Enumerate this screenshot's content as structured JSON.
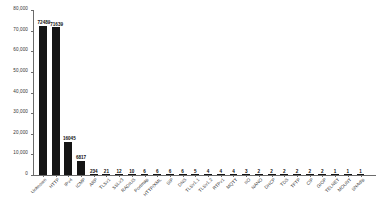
{
  "chart_data": {
    "type": "bar",
    "title": "",
    "subtitle": "",
    "xlabel": "",
    "ylabel": "",
    "ylim": [
      0,
      80000
    ],
    "grid": false,
    "legend": null,
    "y_ticks": [
      0,
      10000,
      20000,
      30000,
      40000,
      50000,
      60000,
      70000,
      80000
    ],
    "y_tick_labels": [
      "0",
      "10,000",
      "20,000",
      "30,000",
      "40,000",
      "50,000",
      "60,000",
      "70,000",
      "80,000"
    ],
    "categories": [
      "Unknown",
      "HTTP",
      "IPv4",
      "ICMP",
      "ARP",
      "TLSv1",
      "SSLv3",
      "RADIUS",
      "Portmap",
      "HTTP/XML",
      "SIP",
      "DNS",
      "TLSv1.1",
      "TLSv1.2",
      "RTPv1",
      "MQTT",
      "IIO",
      "NANO",
      "DHCP",
      "TDS",
      "TFTP",
      "CIP",
      "GIOP",
      "TELNET",
      "MOUNT",
      "SNAdlp"
    ],
    "values": [
      72489,
      71639,
      16045,
      6817,
      234,
      21,
      12,
      10,
      6,
      6,
      6,
      6,
      5,
      4,
      4,
      4,
      3,
      2,
      2,
      2,
      2,
      2,
      2,
      1,
      1,
      1
    ],
    "value_labels": [
      "72489",
      "71639",
      "16045",
      "6817",
      "234",
      "21",
      "12",
      "10",
      "6",
      "6",
      "6",
      "6",
      "5",
      "4",
      "4",
      "4",
      "3",
      "2",
      "2",
      "2",
      "2",
      "2",
      "2",
      "1",
      "1",
      "1"
    ],
    "bar_color": "#151515",
    "axis_color": "#6b6b6b",
    "text_color": "#333333",
    "background": "#ffffff"
  }
}
